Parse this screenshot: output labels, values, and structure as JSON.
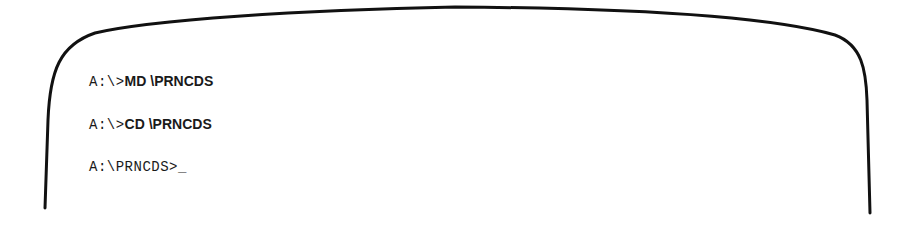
{
  "screen": {
    "lines": [
      {
        "prompt": "A:\\>",
        "command": "MD \\PRNCDS"
      },
      {
        "prompt": "A:\\>",
        "command": "CD \\PRNCDS"
      },
      {
        "prompt": "A:\\PRNCDS>",
        "command": "",
        "cursor": "_"
      }
    ]
  },
  "colors": {
    "frame": "#111111",
    "text": "#1a1a1a",
    "background": "#ffffff"
  }
}
